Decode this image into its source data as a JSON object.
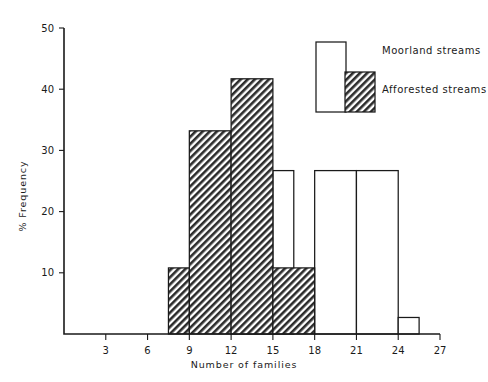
{
  "chart_data": {
    "type": "bar",
    "title": "",
    "subtitle": "",
    "xlabel": "Number of families",
    "ylabel": "% Frequency",
    "xlim": [
      0,
      27
    ],
    "ylim": [
      0,
      50
    ],
    "xticks": [
      3,
      6,
      9,
      12,
      15,
      18,
      21,
      24,
      27
    ],
    "yticks": [
      10,
      20,
      30,
      40,
      50
    ],
    "grid": false,
    "legend_position": "top-right",
    "note": "Overlaid histogram: bin edges given per bar as [start,end] on the x axis; values are % frequency.",
    "series": [
      {
        "name": "Moorland streams",
        "style": "open",
        "fill": "#ffffff",
        "edge": "#1a1a1a",
        "bins": [
          {
            "start": 12.0,
            "end": 15.0,
            "value": 14.8
          },
          {
            "start": 15.0,
            "end": 16.5,
            "value": 26.7
          },
          {
            "start": 18.0,
            "end": 21.0,
            "value": 26.7
          },
          {
            "start": 21.0,
            "end": 24.0,
            "value": 26.7
          },
          {
            "start": 24.0,
            "end": 25.5,
            "value": 2.7
          }
        ]
      },
      {
        "name": "Afforested streams",
        "style": "hatched",
        "fill": "hatch-diagonal",
        "edge": "#1a1a1a",
        "bins": [
          {
            "start": 7.5,
            "end": 9.0,
            "value": 10.8
          },
          {
            "start": 9.0,
            "end": 12.0,
            "value": 33.2
          },
          {
            "start": 12.0,
            "end": 15.0,
            "value": 41.7
          },
          {
            "start": 15.0,
            "end": 18.0,
            "value": 10.8
          }
        ]
      }
    ]
  },
  "axes": {
    "y_label": "% Frequency",
    "x_label": "Number of families",
    "y_tick_labels": [
      "10",
      "20",
      "30",
      "40",
      "50"
    ],
    "x_tick_labels": [
      "3",
      "6",
      "9",
      "12",
      "15",
      "18",
      "21",
      "24",
      "27"
    ]
  },
  "legend": {
    "entries": [
      {
        "label": "Moorland streams",
        "swatch": "open-rect"
      },
      {
        "label": "Afforested streams",
        "swatch": "hatched-rect"
      }
    ]
  },
  "colors": {
    "ink": "#1a1a1a",
    "paper": "#ffffff"
  }
}
